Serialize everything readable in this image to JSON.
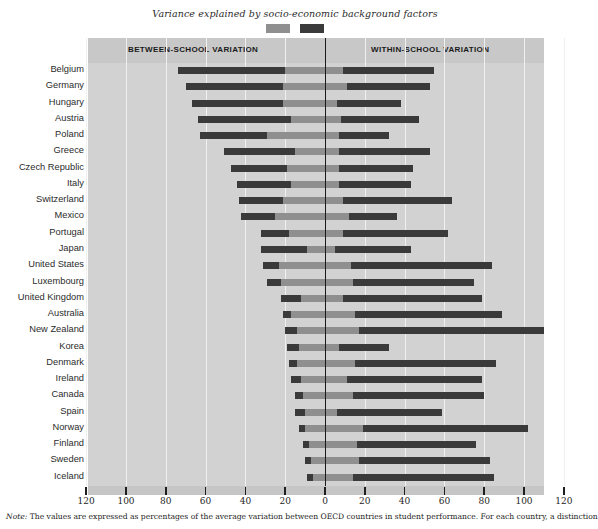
{
  "chart_data": {
    "type": "bar",
    "subtype": "diverging-stacked-horizontal",
    "title": "Variance explained by socio-economic background factors",
    "xlabel": "",
    "ylabel": "",
    "xlim": [
      -120,
      120
    ],
    "tick_labels": [
      "120",
      "100",
      "80",
      "60",
      "40",
      "20",
      "0",
      "20",
      "40",
      "60",
      "80",
      "100",
      "120"
    ],
    "tick_values": [
      -120,
      -100,
      -80,
      -60,
      -40,
      -20,
      0,
      20,
      40,
      60,
      80,
      100,
      120
    ],
    "grid": true,
    "legend_position": "top-center",
    "panel_labels": {
      "left": "BETWEEN-SCHOOL VARIATION",
      "right": "WITHIN-SCHOOL VARIATION"
    },
    "legend": [
      {
        "label": "Variance explained by socio-economic background factors",
        "color": "#8f8f8f"
      },
      {
        "label": "Remaining (unexplained) variance",
        "color": "#3a3a3a"
      }
    ],
    "series": [
      {
        "name": "between_school_total",
        "side": "left",
        "color": "#3a3a3a"
      },
      {
        "name": "between_school_explained",
        "side": "left",
        "color": "#8f8f8f"
      },
      {
        "name": "within_school_explained",
        "side": "right",
        "color": "#8f8f8f"
      },
      {
        "name": "within_school_total",
        "side": "right",
        "color": "#3a3a3a"
      }
    ],
    "categories": [
      "Belgium",
      "Germany",
      "Hungary",
      "Austria",
      "Poland",
      "Greece",
      "Czech Republic",
      "Italy",
      "Switzerland",
      "Mexico",
      "Portugal",
      "Japan",
      "United States",
      "Luxembourg",
      "United Kingdom",
      "Australia",
      "New Zealand",
      "Korea",
      "Denmark",
      "Ireland",
      "Canada",
      "Spain",
      "Norway",
      "Finland",
      "Sweden",
      "Iceland"
    ],
    "rows": [
      {
        "country": "Belgium",
        "between_total": 74,
        "between_explained": 20,
        "within_explained": 9,
        "within_total": 55
      },
      {
        "country": "Germany",
        "between_total": 70,
        "between_explained": 21,
        "within_explained": 11,
        "within_total": 53
      },
      {
        "country": "Hungary",
        "between_total": 67,
        "between_explained": 21,
        "within_explained": 6,
        "within_total": 38
      },
      {
        "country": "Austria",
        "between_total": 64,
        "between_explained": 17,
        "within_explained": 8,
        "within_total": 47
      },
      {
        "country": "Poland",
        "between_total": 63,
        "between_explained": 29,
        "within_explained": 7,
        "within_total": 32
      },
      {
        "country": "Greece",
        "between_total": 51,
        "between_explained": 15,
        "within_explained": 7,
        "within_total": 53
      },
      {
        "country": "Czech Republic",
        "between_total": 47,
        "between_explained": 19,
        "within_explained": 7,
        "within_total": 44
      },
      {
        "country": "Italy",
        "between_total": 44,
        "between_explained": 17,
        "within_explained": 7,
        "within_total": 43
      },
      {
        "country": "Switzerland",
        "between_total": 43,
        "between_explained": 21,
        "within_explained": 9,
        "within_total": 64
      },
      {
        "country": "Mexico",
        "between_total": 42,
        "between_explained": 25,
        "within_explained": 12,
        "within_total": 36
      },
      {
        "country": "Portugal",
        "between_total": 32,
        "between_explained": 18,
        "within_explained": 9,
        "within_total": 62
      },
      {
        "country": "Japan",
        "between_total": 32,
        "between_explained": 9,
        "within_explained": 5,
        "within_total": 43
      },
      {
        "country": "United States",
        "between_total": 31,
        "between_explained": 23,
        "within_explained": 13,
        "within_total": 84
      },
      {
        "country": "Luxembourg",
        "between_total": 29,
        "between_explained": 22,
        "within_explained": 14,
        "within_total": 75
      },
      {
        "country": "United Kingdom",
        "between_total": 22,
        "between_explained": 12,
        "within_explained": 9,
        "within_total": 79
      },
      {
        "country": "Australia",
        "between_total": 21,
        "between_explained": 17,
        "within_explained": 15,
        "within_total": 89
      },
      {
        "country": "New Zealand",
        "between_total": 20,
        "between_explained": 14,
        "within_explained": 17,
        "within_total": 110
      },
      {
        "country": "Korea",
        "between_total": 19,
        "between_explained": 13,
        "within_explained": 7,
        "within_total": 32
      },
      {
        "country": "Denmark",
        "between_total": 18,
        "between_explained": 14,
        "within_explained": 15,
        "within_total": 86
      },
      {
        "country": "Ireland",
        "between_total": 17,
        "between_explained": 12,
        "within_explained": 11,
        "within_total": 79
      },
      {
        "country": "Canada",
        "between_total": 15,
        "between_explained": 11,
        "within_explained": 14,
        "within_total": 80
      },
      {
        "country": "Spain",
        "between_total": 15,
        "between_explained": 10,
        "within_explained": 6,
        "within_total": 59
      },
      {
        "country": "Norway",
        "between_total": 13,
        "between_explained": 10,
        "within_explained": 19,
        "within_total": 102
      },
      {
        "country": "Finland",
        "between_total": 11,
        "between_explained": 8,
        "within_explained": 16,
        "within_total": 76
      },
      {
        "country": "Sweden",
        "between_total": 10,
        "between_explained": 7,
        "within_explained": 17,
        "within_total": 83
      },
      {
        "country": "Iceland",
        "between_total": 9,
        "between_explained": 6,
        "within_explained": 14,
        "within_total": 85
      }
    ]
  },
  "footnote": {
    "lead": "Note:",
    "text": " The values are expressed as percentages of the average variation between OECD countries in student performance. For each country, a distinction"
  },
  "colors": {
    "plot_background": "#d2d2d2",
    "header_band": "#c8c8c8",
    "gridline": "#f0f0f0",
    "zero_line": "#1a1a1a",
    "bar_dark": "#3a3a3a",
    "bar_light": "#8f8f8f",
    "axis_band": "#c6c6c6"
  }
}
